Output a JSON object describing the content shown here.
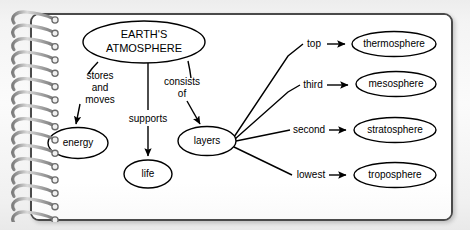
{
  "document": {
    "kind": "spiral-notebook-concept-map",
    "page_background": "#ffffff",
    "page_border_color": "#4a4a4a",
    "outer_background": "#f2f2f2",
    "ink_color": "#000000"
  },
  "diagram": {
    "title_node": {
      "id": "earths-atmosphere",
      "label_line1": "EARTH'S",
      "label_line2": "ATMOSPHERE",
      "cx": 144,
      "cy": 42,
      "rx": 61,
      "ry": 21,
      "font_size": 11
    },
    "nodes": [
      {
        "id": "energy",
        "label": "energy",
        "cx": 78,
        "cy": 143,
        "rx": 30,
        "ry": 15.5,
        "font_size": 10
      },
      {
        "id": "life",
        "label": "life",
        "cx": 148,
        "cy": 174,
        "rx": 24,
        "ry": 14,
        "font_size": 10
      },
      {
        "id": "layers",
        "label": "layers",
        "cx": 207,
        "cy": 141,
        "rx": 29,
        "ry": 14.5,
        "font_size": 10
      },
      {
        "id": "thermosphere",
        "label": "thermosphere",
        "cx": 394,
        "cy": 44,
        "rx": 42,
        "ry": 12.5,
        "font_size": 10
      },
      {
        "id": "mesosphere",
        "label": "mesosphere",
        "cx": 396,
        "cy": 84,
        "rx": 40,
        "ry": 12.5,
        "font_size": 10
      },
      {
        "id": "stratosphere",
        "label": "stratosphere",
        "cx": 395,
        "cy": 130,
        "rx": 41,
        "ry": 12.5,
        "font_size": 10
      },
      {
        "id": "troposphere",
        "label": "troposphere",
        "cx": 395,
        "cy": 175,
        "rx": 41,
        "ry": 12.5,
        "font_size": 10
      }
    ],
    "edges": [
      {
        "id": "edge-stores-and-moves",
        "from": "earths-atmosphere",
        "to": "energy",
        "label_lines": [
          "stores",
          "and",
          "moves"
        ],
        "label_x": 100,
        "label_y": 81,
        "font_size": 10,
        "arrow": true
      },
      {
        "id": "edge-supports",
        "from": "earths-atmosphere",
        "to": "life",
        "label_lines": [
          "supports"
        ],
        "label_x": 148,
        "label_y": 119,
        "font_size": 10,
        "arrow": true
      },
      {
        "id": "edge-consists-of",
        "from": "earths-atmosphere",
        "to": "layers",
        "label_lines": [
          "consists",
          "of"
        ],
        "label_x": 182,
        "label_y": 87,
        "font_size": 10,
        "arrow": true
      },
      {
        "id": "edge-top",
        "from": "layers",
        "to": "thermosphere",
        "label_lines": [
          "top"
        ],
        "label_x": 314,
        "label_y": 44,
        "font_size": 10,
        "arrow": true
      },
      {
        "id": "edge-third",
        "from": "layers",
        "to": "mesosphere",
        "label_lines": [
          "third"
        ],
        "label_x": 313,
        "label_y": 85,
        "font_size": 10,
        "arrow": true
      },
      {
        "id": "edge-second",
        "from": "layers",
        "to": "stratosphere",
        "label_lines": [
          "second"
        ],
        "label_x": 309,
        "label_y": 130,
        "font_size": 10,
        "arrow": true
      },
      {
        "id": "edge-lowest",
        "from": "layers",
        "to": "troposphere",
        "label_lines": [
          "lowest"
        ],
        "label_x": 311,
        "label_y": 175,
        "font_size": 10,
        "arrow": true
      }
    ]
  },
  "binding": {
    "name": "spiral-binding",
    "ring_count": 16,
    "ring_color": "#9a9a9a",
    "ring_highlight": "#e6e6e6",
    "ring_shadow": "#6b6b6b"
  }
}
